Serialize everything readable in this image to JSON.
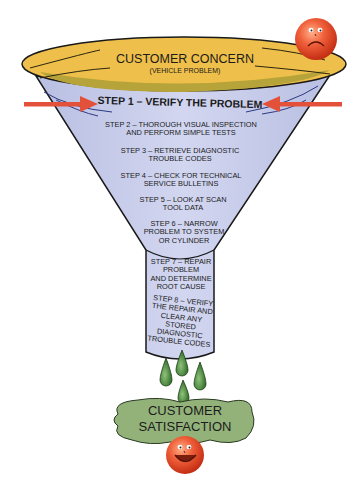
{
  "diagram": {
    "type": "funnel",
    "top": {
      "title": "CUSTOMER CONCERN",
      "subtitle": "(VEHICLE PROBLEM)",
      "face": "sad-face"
    },
    "steps": [
      {
        "id": 1,
        "label": "STEP 1 – VERIFY THE PROBLEM",
        "emphasis": true
      },
      {
        "id": 2,
        "label": "STEP 2 – THOROUGH VISUAL INSPECTION AND PERFORM SIMPLE TESTS"
      },
      {
        "id": 3,
        "label": "STEP 3 – RETRIEVE DIAGNOSTIC TROUBLE CODES"
      },
      {
        "id": 4,
        "label": "STEP 4 – CHECK FOR TECHNICAL SERVICE BULLETINS"
      },
      {
        "id": 5,
        "label": "STEP 5 – LOOK AT SCAN TOOL DATA"
      },
      {
        "id": 6,
        "label": "STEP 6 – NARROW PROBLEM TO SYSTEM OR CYLINDER"
      },
      {
        "id": 7,
        "label": "STEP 7 – REPAIR PROBLEM AND DETERMINE ROOT CAUSE"
      },
      {
        "id": 8,
        "label": "STEP 8 – VERIFY THE REPAIR AND CLEAR ANY STORED DIAGNOSTIC TROUBLE CODES"
      }
    ],
    "step_lines": {
      "s2": [
        "STEP 2 – THOROUGH VISUAL INSPECTION",
        "AND PERFORM SIMPLE TESTS"
      ],
      "s3": [
        "STEP 3 – RETRIEVE DIAGNOSTIC",
        "TROUBLE CODES"
      ],
      "s4": [
        "STEP 4 – CHECK FOR TECHNICAL",
        "SERVICE BULLETINS"
      ],
      "s5": [
        "STEP 5 – LOOK AT SCAN",
        "TOOL DATA"
      ],
      "s6": [
        "STEP 6 – NARROW",
        "PROBLEM TO SYSTEM",
        "OR CYLINDER"
      ],
      "s7": [
        "STEP 7 – REPAIR",
        "PROBLEM",
        "AND DETERMINE",
        "ROOT CAUSE"
      ],
      "s8": [
        "STEP 8 – VERIFY",
        "THE REPAIR AND",
        "CLEAR ANY STORED",
        "DIAGNOSTIC",
        "TROUBLE CODES"
      ]
    },
    "bottom": {
      "lines": [
        "CUSTOMER",
        "SATISFACTION"
      ],
      "face": "happy-face"
    },
    "colors": {
      "funnel_rim": "#e8b840",
      "funnel_inner": "#b9a23a",
      "funnel_body": "#c8cdea",
      "arrow": "#e4513a",
      "drops": "#4f8a3c",
      "cloud": "#93b27a",
      "face": "#e8502f"
    }
  }
}
